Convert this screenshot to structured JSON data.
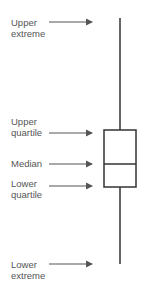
{
  "diagram": {
    "type": "box-plot-anatomy",
    "labels": [
      {
        "id": "upper-extreme",
        "line1": "Upper",
        "line2": "extreme"
      },
      {
        "id": "upper-quartile",
        "line1": "Upper",
        "line2": "quartile"
      },
      {
        "id": "median",
        "line1": "Median",
        "line2": ""
      },
      {
        "id": "lower-quartile",
        "line1": "Lower",
        "line2": "quartile"
      },
      {
        "id": "lower-extreme",
        "line1": "Lower",
        "line2": "extreme"
      }
    ],
    "colors": {
      "line": "#333333",
      "arrow": "#555555",
      "text": "#555555"
    }
  }
}
